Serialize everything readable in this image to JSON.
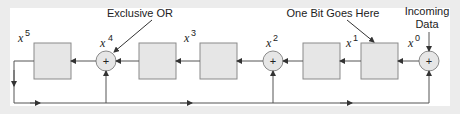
{
  "diagram": {
    "type": "linear feedback shift register (CRC)",
    "colors": {
      "background": "#ececec",
      "panel": "#ffffff",
      "box_fill": "#e6e6e6",
      "box_stroke": "#8a8a8a",
      "line": "#555555"
    },
    "annotations": {
      "xor": "Exclusive OR",
      "one_bit": "One Bit Goes Here",
      "incoming_line1": "Incoming",
      "incoming_line2": "Data"
    },
    "stages": [
      {
        "var": "x",
        "power": "5",
        "kind": "register"
      },
      {
        "var": "x",
        "power": "4",
        "kind": "xor"
      },
      {
        "var": "x",
        "power": "3",
        "kind": "register"
      },
      {
        "var": "",
        "power": "",
        "kind": "register"
      },
      {
        "var": "x",
        "power": "2",
        "kind": "xor"
      },
      {
        "var": "",
        "power": "",
        "kind": "register"
      },
      {
        "var": "x",
        "power": "1",
        "kind": "register"
      },
      {
        "var": "x",
        "power": "0",
        "kind": "xor"
      }
    ],
    "xor_symbol": "+"
  }
}
